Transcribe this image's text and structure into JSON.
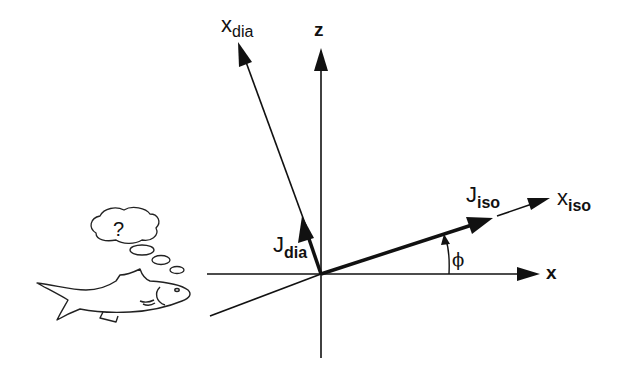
{
  "diagram": {
    "axes": {
      "z_label": "z",
      "x_label": "x"
    },
    "rotated_axes": {
      "x_dia_main": "x",
      "x_dia_sub": "dia",
      "x_iso_main": "x",
      "x_iso_sub": "iso"
    },
    "vectors": {
      "j_iso_main": "J",
      "j_iso_sub": "iso",
      "j_dia_main": "J",
      "j_dia_sub": "dia"
    },
    "angle_label": "ϕ",
    "thought_bubble_text": "?",
    "colors": {
      "line": "#111111",
      "background": "#ffffff"
    }
  }
}
